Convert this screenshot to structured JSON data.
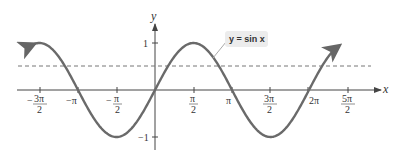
{
  "chart_data": {
    "type": "line",
    "title": "",
    "xlabel": "x",
    "ylabel": "y",
    "series": [
      {
        "name": "y = sin x",
        "function": "sin(x)",
        "x_range": [
          -4.97,
          7.48
        ],
        "style": "solid",
        "color": "#666666"
      },
      {
        "name": "reference line",
        "function": "0.5",
        "style": "dashed",
        "color": "#777777"
      }
    ],
    "x_ticks": [
      {
        "value": -4.712,
        "label_num": "3π",
        "label_den": "2",
        "sign": "−"
      },
      {
        "value": -3.1416,
        "label": "−π"
      },
      {
        "value": -1.5708,
        "label_num": "π",
        "label_den": "2",
        "sign": "−"
      },
      {
        "value": 1.5708,
        "label_num": "π",
        "label_den": "2",
        "sign": ""
      },
      {
        "value": 3.1416,
        "label": "π"
      },
      {
        "value": 4.712,
        "label_num": "3π",
        "label_den": "2",
        "sign": ""
      },
      {
        "value": 6.2832,
        "label": "2π"
      },
      {
        "value": 7.854,
        "label_num": "5π",
        "label_den": "2",
        "sign": ""
      }
    ],
    "y_ticks": [
      {
        "value": 1,
        "label": "1"
      },
      {
        "value": -1,
        "label": "−1"
      }
    ],
    "xlim": [
      -5.4,
      8.6
    ],
    "ylim": [
      -1.2,
      1.5
    ],
    "grid": false,
    "annotations": [
      {
        "text": "y = sin x",
        "points_to": "curve near x≈1.9"
      }
    ]
  },
  "axes": {
    "x_name": "x",
    "y_name": "y"
  },
  "callout": {
    "label": "y = sin x"
  }
}
